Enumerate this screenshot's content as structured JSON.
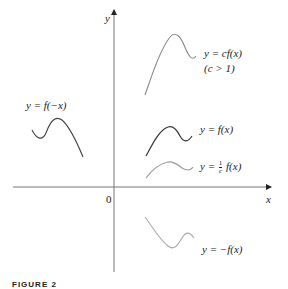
{
  "figure": {
    "caption": "FIGURE 2"
  },
  "axes": {
    "x_label": "x",
    "y_label": "y",
    "origin_label": "0",
    "axis_color": "#777777"
  },
  "curves": [
    {
      "id": "f_neg_x",
      "label": "y = f(−x)",
      "color": "#444444"
    },
    {
      "id": "cf",
      "label": "y = cf(x)",
      "sublabel": "(c > 1)",
      "color": "#888888"
    },
    {
      "id": "f",
      "label": "y = f(x)",
      "color": "#333333"
    },
    {
      "id": "f_over_c",
      "label_prefix": "y =",
      "frac_num": "1",
      "frac_den": "c",
      "label_suffix": "f(x)",
      "color": "#999999"
    },
    {
      "id": "neg_f",
      "label": "y = −f(x)",
      "color": "#aaaaaa"
    }
  ]
}
